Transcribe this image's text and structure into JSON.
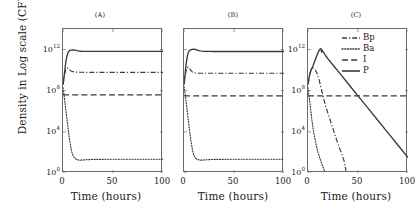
{
  "figure": {
    "ylabel": "Density in Log scale (CFU/g)",
    "xlabel": "Time (hours)"
  },
  "axis": {
    "yticks": [
      {
        "mant": "10",
        "exp": "0"
      },
      {
        "mant": "10",
        "exp": "4"
      },
      {
        "mant": "10",
        "exp": "8"
      },
      {
        "mant": "10",
        "exp": "12"
      }
    ],
    "xticks": [
      "0",
      "50",
      "100"
    ],
    "xlim": [
      0,
      100
    ],
    "ylim_log10": [
      0,
      14
    ]
  },
  "legend": {
    "position": "top-right-panel-C",
    "entries": [
      {
        "label": "Bp",
        "style": "dashdot"
      },
      {
        "label": "Ba",
        "style": "dotted"
      },
      {
        "label": "I",
        "style": "dashed"
      },
      {
        "label": "P",
        "style": "solid"
      }
    ]
  },
  "panels": [
    {
      "title": "(A)"
    },
    {
      "title": "(B)"
    },
    {
      "title": "(C)"
    }
  ],
  "chart_data": [
    {
      "type": "line",
      "title": "(A)",
      "xlabel": "Time (hours)",
      "ylabel": "Density in Log scale (CFU/g)",
      "yscale": "log10",
      "xlim": [
        0,
        100
      ],
      "ylim": [
        0,
        14
      ],
      "series": [
        {
          "name": "P",
          "style": "solid",
          "x": [
            0,
            1,
            2,
            3,
            4,
            5,
            6,
            7,
            8,
            10,
            12,
            14,
            16,
            18,
            20,
            25,
            30,
            40,
            50,
            60,
            70,
            80,
            90,
            100
          ],
          "y_log10": [
            8.6,
            9.3,
            10.2,
            10.9,
            11.4,
            11.7,
            11.85,
            11.92,
            11.95,
            11.97,
            11.95,
            11.9,
            11.86,
            11.84,
            11.83,
            11.82,
            11.82,
            11.82,
            11.82,
            11.82,
            11.82,
            11.82,
            11.82,
            11.82
          ]
        },
        {
          "name": "Bp",
          "style": "dashdot",
          "x": [
            0,
            1,
            2,
            3,
            4,
            5,
            6,
            7,
            8,
            10,
            12,
            15,
            20,
            30,
            40,
            50,
            60,
            70,
            80,
            90,
            100
          ],
          "y_log10": [
            8.6,
            9.2,
            9.8,
            10.1,
            10.2,
            10.2,
            10.1,
            10.0,
            9.92,
            9.85,
            9.82,
            9.8,
            9.79,
            9.79,
            9.79,
            9.79,
            9.79,
            9.79,
            9.79,
            9.79,
            9.79
          ]
        },
        {
          "name": "I",
          "style": "dashed",
          "x": [
            0,
            2,
            5,
            10,
            20,
            40,
            60,
            80,
            100
          ],
          "y_log10": [
            7.6,
            7.6,
            7.6,
            7.6,
            7.6,
            7.6,
            7.6,
            7.6,
            7.6
          ]
        },
        {
          "name": "Ba",
          "style": "dotted",
          "x": [
            0,
            1,
            2,
            3,
            4,
            5,
            6,
            7,
            8,
            9,
            10,
            12,
            14,
            16,
            18,
            20,
            25,
            30,
            40,
            50,
            60,
            70,
            80,
            90,
            100
          ],
          "y_log10": [
            8.3,
            7.6,
            6.8,
            6.0,
            5.2,
            4.4,
            3.6,
            3.0,
            2.4,
            2.0,
            1.7,
            1.4,
            1.3,
            1.25,
            1.25,
            1.27,
            1.3,
            1.32,
            1.33,
            1.34,
            1.34,
            1.34,
            1.34,
            1.34,
            1.34
          ]
        }
      ]
    },
    {
      "type": "line",
      "title": "(B)",
      "xlabel": "Time (hours)",
      "ylabel": "Density in Log scale (CFU/g)",
      "yscale": "log10",
      "xlim": [
        0,
        100
      ],
      "ylim": [
        0,
        14
      ],
      "series": [
        {
          "name": "P",
          "style": "solid",
          "x": [
            0,
            1,
            2,
            3,
            4,
            5,
            6,
            8,
            10,
            12,
            14,
            16,
            18,
            20,
            25,
            30,
            40,
            50,
            60,
            70,
            80,
            90,
            100
          ],
          "y_log10": [
            8.6,
            9.5,
            10.5,
            11.2,
            11.6,
            11.85,
            11.95,
            12.02,
            12.03,
            12.0,
            11.93,
            11.88,
            11.85,
            11.83,
            11.82,
            11.81,
            11.81,
            11.81,
            11.81,
            11.81,
            11.81,
            11.81,
            11.81
          ]
        },
        {
          "name": "Bp",
          "style": "dashdot",
          "x": [
            0,
            1,
            2,
            3,
            4,
            5,
            6,
            7,
            8,
            10,
            12,
            15,
            20,
            30,
            40,
            60,
            80,
            100
          ],
          "y_log10": [
            8.6,
            9.3,
            9.9,
            10.2,
            10.3,
            10.25,
            10.1,
            9.95,
            9.85,
            9.75,
            9.72,
            9.7,
            9.7,
            9.7,
            9.7,
            9.7,
            9.7,
            9.7
          ]
        },
        {
          "name": "I",
          "style": "dashed",
          "x": [
            0,
            2,
            5,
            10,
            20,
            40,
            60,
            80,
            100
          ],
          "y_log10": [
            7.5,
            7.5,
            7.5,
            7.5,
            7.5,
            7.5,
            7.5,
            7.5,
            7.5
          ]
        },
        {
          "name": "Ba",
          "style": "dotted",
          "x": [
            0,
            1,
            2,
            3,
            4,
            5,
            6,
            7,
            8,
            9,
            10,
            12,
            14,
            16,
            18,
            20,
            25,
            30,
            40,
            60,
            80,
            100
          ],
          "y_log10": [
            8.4,
            7.8,
            7.0,
            6.2,
            5.4,
            4.6,
            3.8,
            3.1,
            2.5,
            2.0,
            1.7,
            1.4,
            1.3,
            1.25,
            1.25,
            1.27,
            1.3,
            1.32,
            1.33,
            1.34,
            1.34,
            1.34
          ]
        }
      ]
    },
    {
      "type": "line",
      "title": "(C)",
      "xlabel": "Time (hours)",
      "ylabel": "Density in Log scale (CFU/g)",
      "yscale": "log10",
      "xlim": [
        0,
        100
      ],
      "ylim": [
        0,
        14
      ],
      "series": [
        {
          "name": "P",
          "style": "solid",
          "x": [
            0,
            1,
            2,
            3,
            4,
            5,
            6,
            8,
            10,
            11,
            12,
            13,
            13.5,
            14,
            15,
            16,
            17,
            18,
            20,
            25,
            30,
            40,
            50,
            60,
            70,
            80,
            90,
            100
          ],
          "y_log10": [
            8.6,
            9.2,
            9.7,
            10.0,
            10.2,
            10.4,
            10.7,
            11.2,
            11.7,
            11.9,
            12.05,
            12.1,
            11.75,
            11.95,
            11.8,
            11.65,
            11.5,
            11.35,
            11.1,
            10.5,
            9.9,
            8.7,
            7.5,
            6.3,
            5.1,
            3.9,
            2.7,
            1.5
          ]
        },
        {
          "name": "Bp",
          "style": "dashdot",
          "x": [
            0,
            1,
            2,
            3,
            4,
            5,
            6,
            7,
            8,
            9,
            10,
            11,
            12,
            13,
            14,
            15,
            16,
            18,
            20,
            22,
            24,
            26,
            28,
            30,
            32,
            34,
            36,
            38
          ],
          "y_log10": [
            8.6,
            9.2,
            9.7,
            10.0,
            10.15,
            10.2,
            10.15,
            10.05,
            9.9,
            9.7,
            9.4,
            9.1,
            8.7,
            8.3,
            7.9,
            7.5,
            7.1,
            6.4,
            5.8,
            5.2,
            4.6,
            4.0,
            3.4,
            2.8,
            2.3,
            1.8,
            1.2,
            0.2
          ]
        },
        {
          "name": "I",
          "style": "dashed",
          "x": [
            0,
            2,
            5,
            10,
            20,
            40,
            60,
            80,
            100
          ],
          "y_log10": [
            7.5,
            7.5,
            7.5,
            7.5,
            7.5,
            7.5,
            7.5,
            7.5,
            7.5
          ]
        },
        {
          "name": "Ba",
          "style": "dotted",
          "x": [
            0,
            0.5,
            1,
            1.5,
            2,
            2.5,
            3,
            3.5,
            4,
            5,
            6,
            7,
            8,
            9,
            10,
            11,
            12,
            13,
            14,
            15,
            16,
            17
          ],
          "y_log10": [
            8.3,
            7.9,
            7.5,
            7.1,
            6.7,
            6.3,
            5.9,
            5.5,
            5.1,
            4.4,
            3.8,
            3.3,
            2.8,
            2.4,
            2.0,
            1.7,
            1.4,
            1.1,
            0.85,
            0.6,
            0.35,
            0.1
          ]
        }
      ]
    }
  ],
  "style": {
    "line_color": "#3a3a3a",
    "axis_color": "#6b6b6b",
    "background": "#ffffff"
  }
}
